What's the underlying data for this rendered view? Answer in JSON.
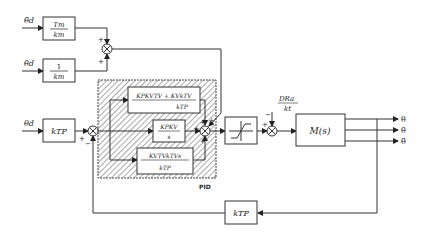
{
  "diagram": {
    "type": "block-diagram",
    "inputs": {
      "accel_ref": "θ̈d",
      "vel_ref": "θ̇d",
      "pos_ref": "θd"
    },
    "blocks": {
      "ff_accel": {
        "num": "Tm",
        "den": "km"
      },
      "ff_vel": {
        "num": "1",
        "den": "km"
      },
      "pos_gain": {
        "label": "kTP"
      },
      "pid_p": {
        "num": "KPKVTV + KVkTV",
        "den": "kTP"
      },
      "pid_i": {
        "num": "KPKV",
        "den": "s"
      },
      "pid_d": {
        "num": "KVTVkTVs",
        "den": "kTP"
      },
      "saturation": {
        "label": "saturation"
      },
      "plant": {
        "label": "M(s)"
      },
      "feedback_gain": {
        "label": "kTP"
      }
    },
    "disturbance": {
      "num": "DRa",
      "den": "kt"
    },
    "pid_group_label": "PID",
    "outputs": [
      "θ",
      "θ̇",
      "θ̈"
    ],
    "signs": {
      "ff_sum": [
        "+",
        "+"
      ],
      "error_sum": [
        "+",
        "−"
      ],
      "pid_sum": [
        "+",
        "+",
        "+",
        "+"
      ],
      "dist_sum": [
        "+",
        "−"
      ]
    }
  }
}
